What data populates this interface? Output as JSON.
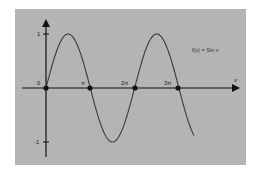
{
  "chart_data": {
    "type": "line",
    "title": "",
    "function_label": "f(x) = Sin x",
    "xlabel": "x",
    "ylabel": "",
    "x_ticks": [
      "0",
      "π",
      "2π",
      "3π"
    ],
    "x_tick_values": [
      0,
      3.1416,
      6.2832,
      9.4248
    ],
    "y_ticks": [
      "1",
      "-1"
    ],
    "y_tick_values": [
      1,
      -1
    ],
    "xlim": [
      0,
      11.0
    ],
    "ylim": [
      -1.25,
      1.25
    ],
    "grid": false,
    "series": [
      {
        "name": "f(x) = Sin x",
        "x": [
          0,
          0.785,
          1.571,
          2.356,
          3.142,
          3.927,
          4.712,
          5.498,
          6.283,
          7.069,
          7.854,
          8.639,
          9.425,
          10.21,
          10.996
        ],
        "values": [
          0,
          0.707,
          1,
          0.707,
          0,
          -0.707,
          -1,
          -0.707,
          0,
          0.707,
          1,
          0.707,
          0,
          -0.707,
          -1
        ]
      }
    ],
    "marked_points": [
      {
        "label": "0",
        "x": 0,
        "y": 0
      },
      {
        "label": "π",
        "x": 3.1416,
        "y": 0
      },
      {
        "label": "2π",
        "x": 6.2832,
        "y": 0
      },
      {
        "label": "3π",
        "x": 9.4248,
        "y": 0
      }
    ],
    "colors": {
      "background": "#b4b4b4",
      "curve": "#3a3a3a",
      "axes": "#111111"
    }
  },
  "labels": {
    "function": "f(x) = Sin x",
    "x_axis": "x",
    "origin": "0",
    "pi": "π",
    "two_pi": "2π",
    "three_pi": "3π",
    "y_one": "1",
    "y_neg_one": "-1"
  }
}
